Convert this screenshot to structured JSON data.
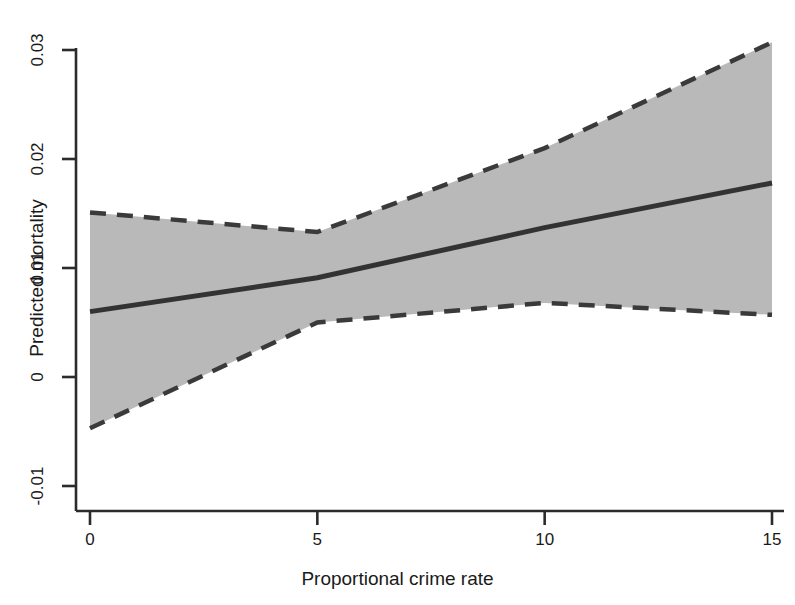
{
  "chart_data": {
    "type": "line",
    "title": "",
    "subtitle": "",
    "xlabel": "Proportional crime rate",
    "ylabel": "Predicted mortality",
    "xlim": [
      0,
      15
    ],
    "ylim": [
      -0.01,
      0.03
    ],
    "xticks": [
      0,
      5,
      10,
      15
    ],
    "xtick_labels": [
      "0",
      "5",
      "10",
      "15"
    ],
    "yticks": [
      -0.01,
      0,
      0.01,
      0.02,
      0.03
    ],
    "ytick_labels": [
      "-0.01",
      "0",
      "0.01",
      "0.02",
      "0.03"
    ],
    "grid": false,
    "legend": null,
    "x": [
      0,
      5,
      10,
      15
    ],
    "series": [
      {
        "name": "Predicted mortality (fit)",
        "style": "solid",
        "color": "#3a3a3a",
        "values": [
          0.006,
          0.0091,
          0.0137,
          0.0178
        ]
      },
      {
        "name": "Upper 95% confidence limit",
        "style": "dashed",
        "color": "#3a3a3a",
        "values": [
          0.0151,
          0.0133,
          0.021,
          0.0307
        ]
      },
      {
        "name": "Lower 95% confidence limit",
        "style": "dashed",
        "color": "#3a3a3a",
        "values": [
          -0.0047,
          0.005,
          0.0068,
          0.0057
        ]
      }
    ],
    "band": {
      "name": "95% confidence interval",
      "fill_color": "#b9b9b9",
      "upper": [
        0.0151,
        0.0133,
        0.021,
        0.0307
      ],
      "lower": [
        -0.0047,
        0.005,
        0.0068,
        0.0057
      ]
    },
    "axis_color": "#2b2b2b"
  },
  "axes": {
    "x_tick_labels": [
      "0",
      "5",
      "10",
      "15"
    ],
    "y_tick_labels": [
      "0.03",
      "0.02",
      "0.01",
      "0",
      "-0.01"
    ],
    "x_axis_title": "Proportional crime rate",
    "y_axis_title": "Predicted mortality"
  }
}
